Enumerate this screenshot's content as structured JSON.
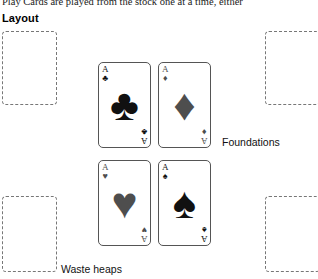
{
  "document": {
    "body_text": "Play Cards are played from the stock one at a time, either",
    "section_heading": "Layout"
  },
  "annotations": {
    "foundations": "Foundations",
    "waste_heaps": "Waste heaps"
  },
  "colors": {
    "black_suit": "#111111",
    "red_suit_grayscale": "#4e4e4e",
    "card_border": "#555555",
    "pile_border": "#777777",
    "page_background": "#ffffff"
  },
  "piles": [
    {
      "id": "top-left",
      "label": "empty-pile"
    },
    {
      "id": "top-right",
      "label": "empty-pile"
    },
    {
      "id": "bottom-left",
      "label": "empty-pile"
    },
    {
      "id": "bottom-right",
      "label": "empty-pile"
    }
  ],
  "cards": [
    {
      "position": "top-left",
      "rank": "A",
      "suit_name": "clubs",
      "suit_glyph": "♣",
      "color_class": "black"
    },
    {
      "position": "top-right",
      "rank": "A",
      "suit_name": "diamonds",
      "suit_glyph": "♦",
      "color_class": "gray"
    },
    {
      "position": "bottom-left",
      "rank": "A",
      "suit_name": "hearts",
      "suit_glyph": "♥",
      "color_class": "gray"
    },
    {
      "position": "bottom-right",
      "rank": "A",
      "suit_name": "spades",
      "suit_glyph": "♠",
      "color_class": "black"
    }
  ]
}
